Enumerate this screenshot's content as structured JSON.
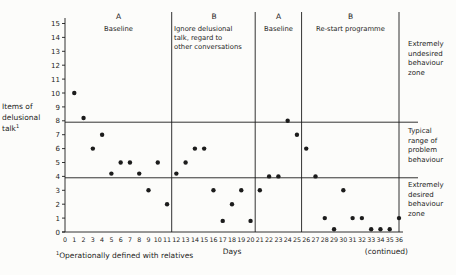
{
  "labels": {
    "y_axis_lines": [
      "Items of",
      "delusional",
      "talk"
    ],
    "y_axis_sup": "1",
    "x_axis_title": "Days",
    "footnote_sup": "1",
    "footnote": "Operationally defined with relatives",
    "continued_note": "(continued)"
  },
  "colors": {
    "ink": "#1c1c1c",
    "background": "#fcfcfa"
  },
  "chart_data": {
    "type": "scatter",
    "title": "",
    "xlabel": "Days",
    "ylabel": "Items of delusional talk",
    "xlim": [
      0,
      36
    ],
    "ylim": [
      0,
      15
    ],
    "grid": false,
    "x_ticks": [
      0,
      1,
      2,
      3,
      4,
      5,
      6,
      7,
      8,
      9,
      10,
      11,
      12,
      13,
      14,
      15,
      16,
      17,
      18,
      19,
      20,
      21,
      22,
      23,
      24,
      25,
      26,
      27,
      28,
      29,
      30,
      31,
      32,
      33,
      34,
      35,
      36
    ],
    "y_ticks": [
      0,
      1,
      2,
      3,
      4,
      5,
      6,
      7,
      8,
      9,
      10,
      11,
      12,
      13,
      14,
      15
    ],
    "zone_lines_y": [
      7.9,
      3.9
    ],
    "zones": [
      {
        "label_lines": [
          "Extremely",
          "undesired",
          "behaviour",
          "zone"
        ]
      },
      {
        "label_lines": [
          "Typical",
          "range of",
          "problem",
          "behaviour"
        ]
      },
      {
        "label_lines": [
          "Extremely",
          "desired",
          "behaviour",
          "zone"
        ]
      }
    ],
    "phases": [
      {
        "letter": "A",
        "label_lines": [
          "Baseline"
        ],
        "day_start": 0,
        "day_end": 11.5
      },
      {
        "letter": "B",
        "label_lines": [
          "Ignore delusional",
          "talk, regard to",
          "other conversations"
        ],
        "day_start": 11.5,
        "day_end": 20.5
      },
      {
        "letter": "A",
        "label_lines": [
          "Baseline"
        ],
        "day_start": 20.5,
        "day_end": 25.5
      },
      {
        "letter": "B",
        "label_lines": [
          "Re-start programme"
        ],
        "day_start": 25.5,
        "day_end": 36
      }
    ],
    "points": [
      {
        "day": 1,
        "value": 10
      },
      {
        "day": 2,
        "value": 8.2
      },
      {
        "day": 3,
        "value": 6
      },
      {
        "day": 4,
        "value": 7
      },
      {
        "day": 5,
        "value": 4.2
      },
      {
        "day": 6,
        "value": 5
      },
      {
        "day": 7,
        "value": 5
      },
      {
        "day": 8,
        "value": 4.2
      },
      {
        "day": 9,
        "value": 3
      },
      {
        "day": 10,
        "value": 5
      },
      {
        "day": 11,
        "value": 2
      },
      {
        "day": 12,
        "value": 4.2
      },
      {
        "day": 13,
        "value": 5
      },
      {
        "day": 14,
        "value": 6
      },
      {
        "day": 15,
        "value": 6
      },
      {
        "day": 16,
        "value": 3
      },
      {
        "day": 17,
        "value": 0.8
      },
      {
        "day": 18,
        "value": 2
      },
      {
        "day": 19,
        "value": 3
      },
      {
        "day": 20,
        "value": 0.8
      },
      {
        "day": 21,
        "value": 3
      },
      {
        "day": 22,
        "value": 4
      },
      {
        "day": 23,
        "value": 4
      },
      {
        "day": 24,
        "value": 8
      },
      {
        "day": 25,
        "value": 7
      },
      {
        "day": 26,
        "value": 6
      },
      {
        "day": 27,
        "value": 4
      },
      {
        "day": 28,
        "value": 1
      },
      {
        "day": 29,
        "value": 0.2
      },
      {
        "day": 30,
        "value": 3
      },
      {
        "day": 31,
        "value": 1
      },
      {
        "day": 32,
        "value": 1
      },
      {
        "day": 33,
        "value": 0.2
      },
      {
        "day": 34,
        "value": 0.2
      },
      {
        "day": 35,
        "value": 0.2
      },
      {
        "day": 36,
        "value": 1
      }
    ]
  }
}
